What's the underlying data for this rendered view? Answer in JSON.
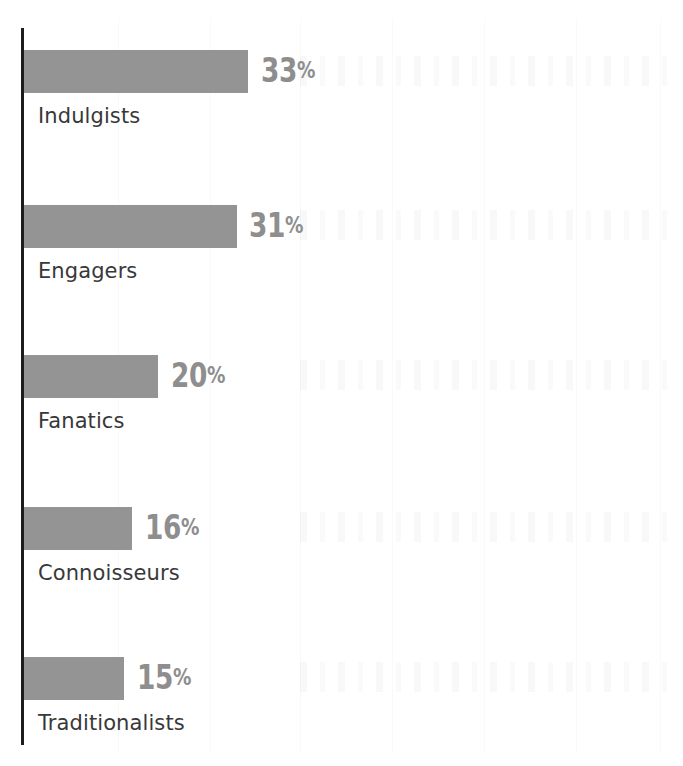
{
  "chart_data": {
    "type": "bar",
    "orientation": "horizontal",
    "title": "",
    "subtitle": "",
    "xlabel": "",
    "ylabel": "",
    "categories": [
      "Indulgists",
      "Engagers",
      "Fanatics",
      "Connoisseurs",
      "Traditionalists"
    ],
    "values": [
      33,
      31,
      20,
      16,
      15
    ],
    "value_labels": [
      "33%",
      "31%",
      "20%",
      "16%",
      "15%"
    ],
    "value_unit": "%",
    "xlim": [
      0,
      33
    ],
    "grid": false,
    "legend": null,
    "annotations": [],
    "colors": {
      "bar": "#949494",
      "value_label": "#8e8e8e",
      "category_label": "#383838",
      "axis_line": "#1d1d1d",
      "background": "#ffffff"
    },
    "bars": [
      {
        "category": "Indulgists",
        "value": 33,
        "value_label": "33",
        "unit": "%",
        "bar_width_px": 224,
        "value_label_left_px": 261,
        "row_top_px": 50
      },
      {
        "category": "Engagers",
        "value": 31,
        "value_label": "31",
        "unit": "%",
        "bar_width_px": 213,
        "value_label_left_px": 249,
        "row_top_px": 205
      },
      {
        "category": "Fanatics",
        "value": 20,
        "value_label": "20",
        "unit": "%",
        "bar_width_px": 134,
        "value_label_left_px": 171,
        "row_top_px": 355
      },
      {
        "category": "Connoisseurs",
        "value": 16,
        "value_label": "16",
        "unit": "%",
        "bar_width_px": 108,
        "value_label_left_px": 145,
        "row_top_px": 507
      },
      {
        "category": "Traditionalists",
        "value": 15,
        "value_label": "15",
        "unit": "%",
        "bar_width_px": 100,
        "value_label_left_px": 137,
        "row_top_px": 657
      }
    ]
  }
}
